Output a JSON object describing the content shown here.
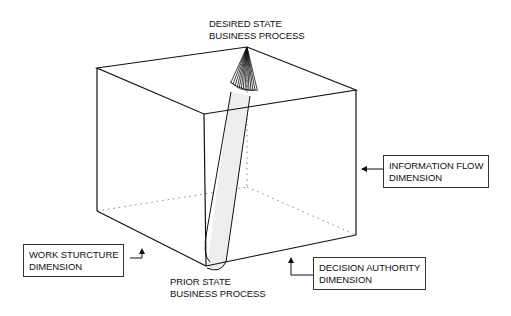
{
  "diagram": {
    "type": "3d-cube-transformation",
    "desired_state": {
      "line1": "DESIRED STATE",
      "line2": "BUSINESS PROCESS"
    },
    "prior_state": {
      "line1": "PRIOR STATE",
      "line2": "BUSINESS PROCESS"
    },
    "dimensions": {
      "information_flow": {
        "line1": "INFORMATION FLOW",
        "line2": "DIMENSION"
      },
      "work_structure": {
        "line1": "WORK STURCTURE",
        "line2": "DIMENSION"
      },
      "decision_authority": {
        "line1": "DECISION AUTHORITY",
        "line2": "DIMENSION"
      }
    },
    "colors": {
      "line": "#111111",
      "hidden_edge": "#888888",
      "cylinder_fill": "#eeeeee",
      "background": "#ffffff"
    }
  }
}
